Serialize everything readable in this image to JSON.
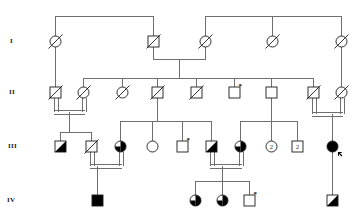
{
  "chart": {
    "type": "pedigree",
    "width": 361,
    "height": 222,
    "colors": {
      "line": "#6f6f6f",
      "symbol_stroke": "#1a1a1a",
      "affected_fill": "#000000",
      "unaffected_fill": "#ffffff"
    },
    "legend_semantics": {
      "square": "male",
      "circle": "female",
      "slash": "deceased",
      "filled": "affected",
      "half-filled": "carrier (half shaded)",
      "diagonal-filled": "partially affected (upper-left / lower-right shading)",
      "asterisk": "examined / sampled individual",
      "arrow": "proband",
      "number-in-symbol": "number of siblings of that sex",
      "double-line": "consanguineous mating"
    }
  },
  "generations": [
    {
      "id": "gen-1",
      "label": "I",
      "y": 41
    },
    {
      "id": "gen-2",
      "label": "II",
      "y": 92
    },
    {
      "id": "gen-3",
      "label": "III",
      "y": 146
    },
    {
      "id": "gen-4",
      "label": "IV",
      "y": 200
    }
  ],
  "generation_label_x": 12,
  "individuals": [
    {
      "id": "I-1",
      "gen": "I",
      "sex": "female",
      "x": 55,
      "y": 41,
      "state": "slashed",
      "mark": null,
      "count": null
    },
    {
      "id": "I-2",
      "gen": "I",
      "sex": "male",
      "x": 153,
      "y": 41,
      "state": "slashed",
      "mark": null,
      "count": null
    },
    {
      "id": "I-3",
      "gen": "I",
      "sex": "female",
      "x": 205,
      "y": 41,
      "state": "slashed",
      "mark": null,
      "count": null
    },
    {
      "id": "I-4",
      "gen": "I",
      "sex": "female",
      "x": 272,
      "y": 41,
      "state": "slashed",
      "mark": null,
      "count": null
    },
    {
      "id": "I-5",
      "gen": "I",
      "sex": "female",
      "x": 341,
      "y": 41,
      "state": "slashed",
      "mark": null,
      "count": null
    },
    {
      "id": "II-1",
      "gen": "II",
      "sex": "male",
      "x": 55,
      "y": 92,
      "state": "slashed",
      "mark": null,
      "count": null
    },
    {
      "id": "II-2",
      "gen": "II",
      "sex": "female",
      "x": 83,
      "y": 92,
      "state": "slashed",
      "mark": null,
      "count": null
    },
    {
      "id": "II-3",
      "gen": "II",
      "sex": "female",
      "x": 122,
      "y": 92,
      "state": "slashed",
      "mark": null,
      "count": null
    },
    {
      "id": "II-4",
      "gen": "II",
      "sex": "male",
      "x": 157,
      "y": 92,
      "state": "slashed",
      "mark": null,
      "count": null
    },
    {
      "id": "II-5",
      "gen": "II",
      "sex": "male",
      "x": 196,
      "y": 92,
      "state": "slashed",
      "mark": null,
      "count": null
    },
    {
      "id": "II-6",
      "gen": "II",
      "sex": "male",
      "x": 234,
      "y": 92,
      "state": "empty",
      "mark": "asterisk",
      "count": null
    },
    {
      "id": "II-7",
      "gen": "II",
      "sex": "male",
      "x": 271,
      "y": 92,
      "state": "empty",
      "mark": null,
      "count": null
    },
    {
      "id": "II-8",
      "gen": "II",
      "sex": "male",
      "x": 313,
      "y": 92,
      "state": "slashed",
      "mark": null,
      "count": null
    },
    {
      "id": "II-9",
      "gen": "II",
      "sex": "female",
      "x": 341,
      "y": 92,
      "state": "slashed",
      "mark": null,
      "count": null
    },
    {
      "id": "III-1",
      "gen": "III",
      "sex": "male",
      "x": 60,
      "y": 146,
      "state": "diagonal",
      "mark": null,
      "count": null
    },
    {
      "id": "III-2",
      "gen": "III",
      "sex": "male",
      "x": 91,
      "y": 146,
      "state": "slashed",
      "mark": null,
      "count": null
    },
    {
      "id": "III-3",
      "gen": "III",
      "sex": "female",
      "x": 120,
      "y": 146,
      "state": "half",
      "mark": null,
      "count": null
    },
    {
      "id": "III-4",
      "gen": "III",
      "sex": "female",
      "x": 152,
      "y": 146,
      "state": "empty",
      "mark": null,
      "count": null
    },
    {
      "id": "III-5",
      "gen": "III",
      "sex": "male",
      "x": 182,
      "y": 146,
      "state": "empty",
      "mark": "asterisk",
      "count": null
    },
    {
      "id": "III-6",
      "gen": "III",
      "sex": "male",
      "x": 211,
      "y": 146,
      "state": "diagonal",
      "mark": null,
      "count": null
    },
    {
      "id": "III-7",
      "gen": "III",
      "sex": "female",
      "x": 240,
      "y": 146,
      "state": "half",
      "mark": null,
      "count": null
    },
    {
      "id": "III-8",
      "gen": "III",
      "sex": "female",
      "x": 271,
      "y": 146,
      "state": "empty",
      "mark": null,
      "count": "2"
    },
    {
      "id": "III-9",
      "gen": "III",
      "sex": "male",
      "x": 297,
      "y": 146,
      "state": "empty",
      "mark": null,
      "count": "2"
    },
    {
      "id": "III-10",
      "gen": "III",
      "sex": "female",
      "x": 332,
      "y": 146,
      "state": "filled",
      "mark": "proband",
      "count": null
    },
    {
      "id": "IV-1",
      "gen": "IV",
      "sex": "male",
      "x": 97,
      "y": 200,
      "state": "filled",
      "mark": null,
      "count": null
    },
    {
      "id": "IV-2",
      "gen": "IV",
      "sex": "female",
      "x": 195,
      "y": 200,
      "state": "half",
      "mark": null,
      "count": null
    },
    {
      "id": "IV-3",
      "gen": "IV",
      "sex": "female",
      "x": 222,
      "y": 200,
      "state": "half",
      "mark": null,
      "count": null
    },
    {
      "id": "IV-4",
      "gen": "IV",
      "sex": "male",
      "x": 249,
      "y": 200,
      "state": "empty",
      "mark": "asterisk",
      "count": null
    },
    {
      "id": "IV-5",
      "gen": "IV",
      "sex": "male",
      "x": 332,
      "y": 200,
      "state": "diagonal",
      "mark": null,
      "count": null
    }
  ],
  "matings": [
    {
      "id": "mating-I-2_I-3",
      "type": "normal",
      "partners": [
        "I-2",
        "I-3"
      ]
    },
    {
      "id": "mating-II-1_II-2",
      "type": "consanguineous",
      "partners": [
        "II-1",
        "II-2"
      ]
    },
    {
      "id": "mating-II-8_II-9",
      "type": "consanguineous",
      "partners": [
        "II-8",
        "II-9"
      ]
    },
    {
      "id": "mating-III-2_III-3",
      "type": "consanguineous",
      "partners": [
        "III-2",
        "III-3"
      ]
    },
    {
      "id": "mating-III-6_III-7",
      "type": "consanguineous",
      "partners": [
        "III-6",
        "III-7"
      ]
    }
  ],
  "sibships": [
    {
      "id": "sibship-gen1-left",
      "children": [
        "I-1",
        "I-2"
      ]
    },
    {
      "id": "sibship-gen1-right",
      "children": [
        "I-3",
        "I-4",
        "I-5"
      ]
    },
    {
      "id": "sibship-gen2",
      "children": [
        "II-1",
        "II-2",
        "II-3",
        "II-4",
        "II-5",
        "II-6",
        "II-7",
        "II-8",
        "II-9"
      ]
    },
    {
      "id": "sibship-gen3-left",
      "children": [
        "III-1",
        "III-2"
      ]
    },
    {
      "id": "sibship-gen3-mid",
      "children": [
        "III-3",
        "III-4",
        "III-5",
        "III-6"
      ]
    },
    {
      "id": "sibship-gen3-right",
      "children": [
        "III-7",
        "III-8",
        "III-9"
      ]
    },
    {
      "id": "sibship-gen4-mid",
      "children": [
        "IV-2",
        "IV-3",
        "IV-4"
      ]
    }
  ]
}
